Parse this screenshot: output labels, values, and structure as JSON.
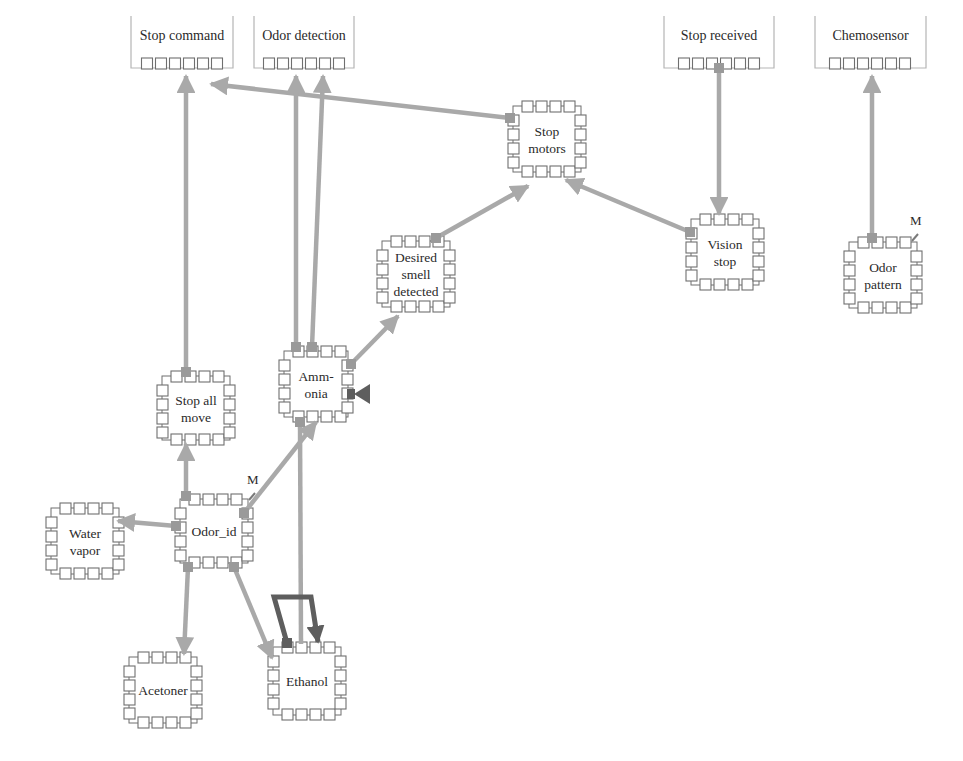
{
  "colors": {
    "arrow": "#a9a9a9",
    "arrow_dark": "#5e5e5e",
    "port_border": "#6f6f6f",
    "port_fill": "#ffffff",
    "port_active": "#9a9a9a",
    "io_bracket": "#b5b5b5",
    "text": "#2a2a2a"
  },
  "io_nodes": [
    {
      "id": "stop_command",
      "label": "Stop command",
      "x": 131,
      "y": 16,
      "w": 102,
      "cx": 182,
      "ports": 6
    },
    {
      "id": "odor_detection",
      "label": "Odor detection",
      "x": 254,
      "y": 16,
      "w": 100,
      "cx": 304,
      "ports": 6
    },
    {
      "id": "stop_received",
      "label": "Stop received",
      "x": 664,
      "y": 16,
      "w": 110,
      "cx": 719,
      "ports": 6
    },
    {
      "id": "chemosensor",
      "label": "Chemosensor",
      "x": 815,
      "y": 16,
      "w": 111,
      "cx": 870,
      "ports": 6
    }
  ],
  "nodes": [
    {
      "id": "stop_motors",
      "label": [
        "Stop",
        "motors"
      ],
      "x": 508,
      "y": 101,
      "w": 78,
      "h": 76
    },
    {
      "id": "desired_smell",
      "label": [
        "Desired",
        "smell",
        "detected"
      ],
      "x": 377,
      "y": 236,
      "w": 78,
      "h": 76
    },
    {
      "id": "vision_stop",
      "label": [
        "Vision",
        "stop"
      ],
      "x": 686,
      "y": 214,
      "w": 78,
      "h": 76
    },
    {
      "id": "odor_pattern",
      "label": [
        "Odor",
        "pattern"
      ],
      "x": 844,
      "y": 237,
      "w": 78,
      "h": 76,
      "m": true
    },
    {
      "id": "ammonia",
      "label": [
        "Amm-",
        "onia"
      ],
      "x": 279,
      "y": 346,
      "w": 74,
      "h": 76
    },
    {
      "id": "stop_all_move",
      "label": [
        "Stop all",
        "move"
      ],
      "x": 157,
      "y": 371,
      "w": 78,
      "h": 74
    },
    {
      "id": "water_vapor",
      "label": [
        "Water",
        "vapor"
      ],
      "x": 46,
      "y": 503,
      "w": 78,
      "h": 76
    },
    {
      "id": "odor_id",
      "label": [
        "Odor_id"
      ],
      "x": 175,
      "y": 494,
      "w": 78,
      "h": 74,
      "m": true
    },
    {
      "id": "acetoner",
      "label": [
        "Acetoner"
      ],
      "x": 124,
      "y": 652,
      "w": 78,
      "h": 76
    },
    {
      "id": "ethanol",
      "label": [
        "Ethanol"
      ],
      "x": 268,
      "y": 642,
      "w": 78,
      "h": 78
    }
  ],
  "edges": [
    {
      "from": "stop_all_move",
      "to": "stop_command",
      "pts": [
        [
          186,
          372
        ],
        [
          186,
          76
        ]
      ],
      "head": "up"
    },
    {
      "from": "stop_motors",
      "to": "stop_command",
      "pts": [
        [
          510,
          118
        ],
        [
          211,
          84
        ]
      ],
      "head": "end"
    },
    {
      "from": "ammonia",
      "to": "odor_detection",
      "pts": [
        [
          296,
          347
        ],
        [
          296,
          76
        ]
      ],
      "head": "up"
    },
    {
      "from": "ammonia",
      "to": "odor_detection",
      "pts": [
        [
          312,
          347
        ],
        [
          323,
          76
        ]
      ],
      "head": "up"
    },
    {
      "from": "stop_received",
      "to": "vision_stop",
      "pts": [
        [
          719,
          68
        ],
        [
          719,
          214
        ]
      ],
      "head": "down"
    },
    {
      "from": "odor_pattern",
      "to": "chemosensor",
      "pts": [
        [
          872,
          238
        ],
        [
          872,
          76
        ]
      ],
      "head": "up"
    },
    {
      "from": "vision_stop",
      "to": "stop_motors",
      "pts": [
        [
          690,
          232
        ],
        [
          566,
          180
        ]
      ],
      "head": "end"
    },
    {
      "from": "desired_smell",
      "to": "stop_motors",
      "pts": [
        [
          436,
          238
        ],
        [
          528,
          186
        ]
      ],
      "head": "end"
    },
    {
      "from": "ammonia",
      "to": "desired_smell",
      "pts": [
        [
          351,
          364
        ],
        [
          398,
          316
        ]
      ],
      "head": "end"
    },
    {
      "from": "odor_id",
      "to": "stop_all_move",
      "pts": [
        [
          186,
          496
        ],
        [
          186,
          444
        ]
      ],
      "head": "end"
    },
    {
      "from": "odor_id",
      "to": "water_vapor",
      "pts": [
        [
          176,
          526
        ],
        [
          118,
          521
        ]
      ],
      "head": "end"
    },
    {
      "from": "odor_id",
      "to": "ammonia",
      "pts": [
        [
          244,
          513
        ],
        [
          316,
          422
        ]
      ],
      "head": "end"
    },
    {
      "from": "odor_id",
      "to": "acetoner",
      "pts": [
        [
          188,
          567
        ],
        [
          184,
          654
        ]
      ],
      "head": "end"
    },
    {
      "from": "odor_id",
      "to": "ethanol",
      "pts": [
        [
          234,
          567
        ],
        [
          272,
          658
        ]
      ],
      "head": "end"
    },
    {
      "from": "ammonia",
      "to": "ethanol",
      "pts": [
        [
          300,
          422
        ],
        [
          301,
          644
        ]
      ],
      "head": "none"
    }
  ],
  "dark_edges": [
    {
      "from": "ethanol",
      "to": "ethanol",
      "pts": [
        [
          287,
          643
        ],
        [
          274,
          597
        ],
        [
          311,
          597
        ],
        [
          318,
          642
        ]
      ],
      "head": "end"
    }
  ],
  "ammonia_side_marker": {
    "x": 351,
    "y": 394
  },
  "m_labels": [
    {
      "node": "odor_id",
      "text": "M",
      "x": 247,
      "y": 484
    },
    {
      "node": "odor_pattern",
      "text": "M",
      "x": 910,
      "y": 225
    }
  ]
}
